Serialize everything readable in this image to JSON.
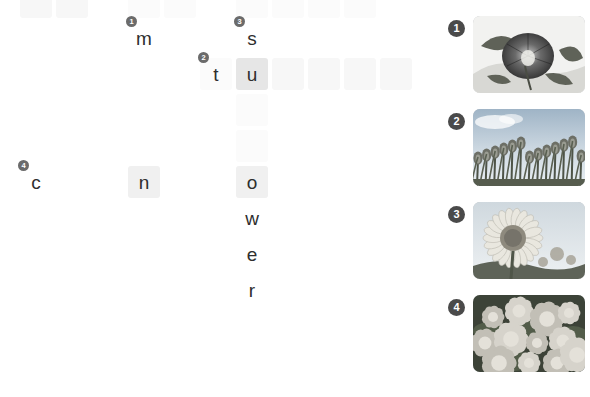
{
  "worksheet": {
    "type": "picture-crossword-puzzle",
    "theme": "flowers",
    "grid": {
      "cell_size": 32,
      "pitch_x": 36,
      "pitch_y": 36,
      "origin_x": 20,
      "origin_y": -14,
      "cells": [
        {
          "col": 0,
          "row": 0,
          "letter": "",
          "fill": "fill-faint"
        },
        {
          "col": 1,
          "row": 0,
          "letter": "",
          "fill": "fill-faint"
        },
        {
          "col": 3,
          "row": 0,
          "letter": "",
          "fill": "fill-ghost"
        },
        {
          "col": 4,
          "row": 0,
          "letter": "",
          "fill": "fill-ghost"
        },
        {
          "col": 6,
          "row": 0,
          "letter": "",
          "fill": "fill-ghost"
        },
        {
          "col": 7,
          "row": 0,
          "letter": "",
          "fill": "fill-ghost"
        },
        {
          "col": 8,
          "row": 0,
          "letter": "",
          "fill": "fill-ghost"
        },
        {
          "col": 9,
          "row": 0,
          "letter": "",
          "fill": "fill-ghost"
        },
        {
          "col": 3,
          "row": 1,
          "letter": "m",
          "fill": "fill-none"
        },
        {
          "col": 6,
          "row": 1,
          "letter": "s",
          "fill": "fill-none"
        },
        {
          "col": 6,
          "row": 2,
          "letter": "u",
          "fill": "fill-strong"
        },
        {
          "col": 5,
          "row": 2,
          "letter": "t",
          "fill": "fill-ghost"
        },
        {
          "col": 7,
          "row": 2,
          "letter": "",
          "fill": "fill-faint"
        },
        {
          "col": 8,
          "row": 2,
          "letter": "",
          "fill": "fill-faint"
        },
        {
          "col": 9,
          "row": 2,
          "letter": "",
          "fill": "fill-faint"
        },
        {
          "col": 10,
          "row": 2,
          "letter": "",
          "fill": "fill-faint"
        },
        {
          "col": 6,
          "row": 3,
          "letter": "",
          "fill": "fill-ghost"
        },
        {
          "col": 6,
          "row": 4,
          "letter": "",
          "fill": "fill-ghost"
        },
        {
          "col": 6,
          "row": 5,
          "letter": "",
          "fill": "fill-ghost"
        },
        {
          "col": 0,
          "row": 5,
          "letter": "c",
          "fill": "fill-none"
        },
        {
          "col": 3,
          "row": 5,
          "letter": "n",
          "fill": "fill-mid"
        },
        {
          "col": 6,
          "row": 5,
          "letter": "o",
          "fill": "fill-mid"
        },
        {
          "col": 6,
          "row": 6,
          "letter": "w",
          "fill": "fill-none"
        },
        {
          "col": 6,
          "row": 7,
          "letter": "e",
          "fill": "fill-none"
        },
        {
          "col": 6,
          "row": 8,
          "letter": "r",
          "fill": "fill-none"
        }
      ],
      "clue_markers": [
        {
          "number": "1",
          "col": 3,
          "row": 1
        },
        {
          "number": "2",
          "col": 5,
          "row": 2
        },
        {
          "number": "3",
          "col": 6,
          "row": 1
        },
        {
          "number": "4",
          "col": 0,
          "row": 5
        }
      ]
    },
    "picture_clues": [
      {
        "number": "1",
        "answer_hint": "m",
        "image_name": "morning-glory-photo",
        "alt": "close-up of a dark morning glory flower with leaves"
      },
      {
        "number": "2",
        "answer_hint": "tu",
        "image_name": "tulip-field-photo",
        "alt": "field of tulips photographed from below against a bright sky"
      },
      {
        "number": "3",
        "answer_hint": "s",
        "image_name": "sunflower-photo",
        "alt": "a single sunflower head against a pale sky"
      },
      {
        "number": "4",
        "answer_hint": "c n o",
        "image_name": "carnations-photo",
        "alt": "a cluster of carnation blossoms filling the frame"
      }
    ]
  }
}
